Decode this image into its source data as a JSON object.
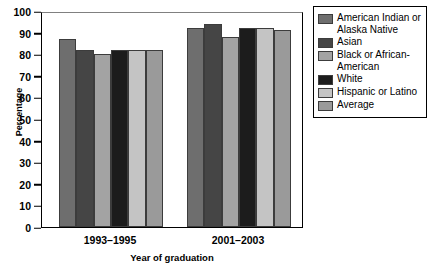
{
  "chart_data": {
    "type": "bar",
    "title": "",
    "xlabel": "Year of graduation",
    "ylabel": "Percentage",
    "categories": [
      "1993–1995",
      "2001–2003"
    ],
    "ylim": [
      0,
      100
    ],
    "yticks": [
      0,
      10,
      20,
      30,
      40,
      50,
      60,
      70,
      80,
      90,
      100
    ],
    "grid": false,
    "legend_position": "right",
    "series": [
      {
        "name": "American Indian or Alaska Native",
        "color": "#6e6e6e",
        "values": [
          87,
          92
        ]
      },
      {
        "name": "Asian",
        "color": "#454545",
        "values": [
          82,
          94
        ]
      },
      {
        "name": "Black or African-American",
        "color": "#a3a3a3",
        "values": [
          80,
          88
        ]
      },
      {
        "name": "White",
        "color": "#1c1c1c",
        "values": [
          82,
          92
        ]
      },
      {
        "name": "Hispanic or Latino",
        "color": "#c4c4c4",
        "values": [
          82,
          92
        ]
      },
      {
        "name": "Average",
        "color": "#9a9a9a",
        "values": [
          82,
          91
        ]
      }
    ]
  },
  "legend": {
    "entries": [
      {
        "label": "American Indian or Alaska Native"
      },
      {
        "label": "Asian"
      },
      {
        "label": "Black or African-American"
      },
      {
        "label": "White"
      },
      {
        "label": "Hispanic or Latino"
      },
      {
        "label": "Average"
      }
    ]
  },
  "axis": {
    "y_title": "Percentage",
    "x_title": "Year of graduation",
    "y_tick_labels": [
      "100",
      "90",
      "80",
      "70",
      "60",
      "50",
      "40",
      "30",
      "20",
      "10",
      "0"
    ],
    "x_tick_labels": [
      "1993–1995",
      "2001–2003"
    ]
  }
}
